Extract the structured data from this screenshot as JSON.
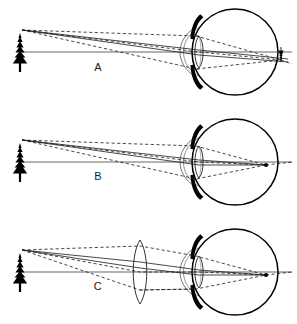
{
  "figure": {
    "width": 297,
    "height": 324,
    "background_color": "#ffffff",
    "ink_color": "#000000",
    "ray_color": "#1a1a1a"
  },
  "panels": [
    {
      "id": "panel-a",
      "letter": "A",
      "letter_x": 98,
      "letter_y": 71,
      "origin_y": 52,
      "object_label": "fir-tree",
      "image_label": "inverted-tree-image",
      "image_position": "behind-eye",
      "image_x": 281,
      "image_y": 55,
      "has_corrective_lens": false,
      "focus_description": "rays converge behind the retina"
    },
    {
      "id": "panel-b",
      "letter": "B",
      "letter_x": 98,
      "letter_y": 180,
      "origin_y": 162,
      "object_label": "fir-tree",
      "image_label": "point-image-on-retina",
      "image_position": "on-retina",
      "image_x": 266,
      "image_y": 164,
      "has_corrective_lens": false,
      "focus_description": "rays converge at the retina"
    },
    {
      "id": "panel-c",
      "letter": "C",
      "letter_x": 98,
      "letter_y": 290,
      "origin_y": 272,
      "object_label": "fir-tree",
      "image_label": "point-image-on-retina",
      "image_position": "on-retina",
      "image_x": 266,
      "image_y": 276,
      "has_corrective_lens": true,
      "corrective_lens_x": 140,
      "focus_description": "external convex lens brings rays to focus on the retina"
    }
  ],
  "eye_parts": {
    "eyeball": "eyeball-outline",
    "cornea": "cornea-arc",
    "iris_upper": "iris-upper",
    "iris_lower": "iris-lower",
    "crystalline_lens": "crystalline-lens",
    "optical_axis": "optical-axis",
    "anterior_chamber": "anterior-chamber-arc"
  },
  "ray_types": {
    "solid": "principal-rays",
    "dashed": "marginal-ray-bundle"
  }
}
